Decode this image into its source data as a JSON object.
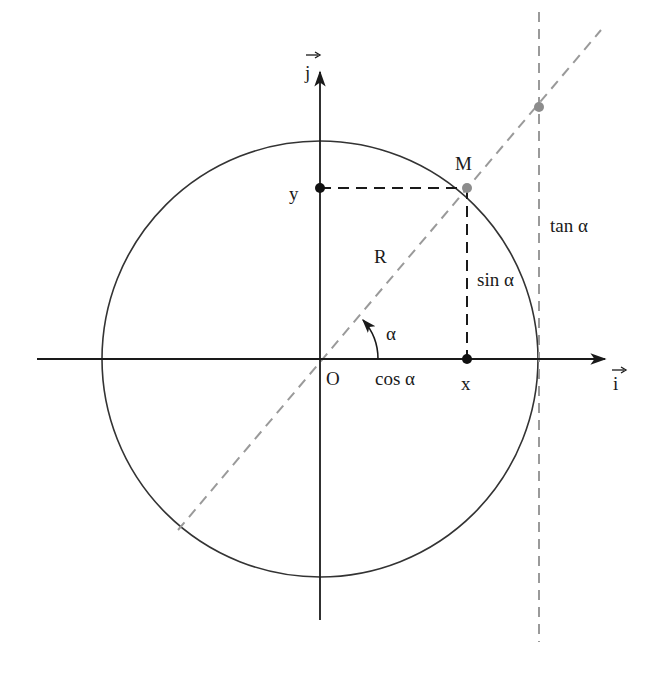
{
  "diagram": {
    "type": "unit-circle-trigonometry",
    "colors": {
      "background": "#ffffff",
      "axis": "#1a1a1a",
      "circle": "#333333",
      "projection_dash": "#1a1a1a",
      "radius_dash": "#9a9a9a",
      "tangent_dash": "#9a9a9a",
      "point_black": "#111111",
      "point_grey": "#8c8c8c"
    },
    "labels": {
      "unit_vector_j": "j",
      "unit_vector_i": "i",
      "origin": "O",
      "point_m": "M",
      "y_proj": "y",
      "x_proj": "x",
      "radius": "R",
      "angle": "α",
      "cos": "cos α",
      "sin": "sin α",
      "tan": "tan α"
    },
    "geometry": {
      "origin": [
        320,
        359
      ],
      "radius": 218,
      "point_m": [
        467,
        188
      ],
      "point_y": [
        320,
        188
      ],
      "point_x": [
        467,
        359
      ],
      "tangent_x": 539,
      "tangent_point": [
        539,
        107
      ],
      "x_axis": [
        37,
        605
      ],
      "y_axis": [
        620,
        70
      ],
      "diagonal": [
        [
          178,
          530
        ],
        [
          601,
          30
        ]
      ]
    }
  }
}
